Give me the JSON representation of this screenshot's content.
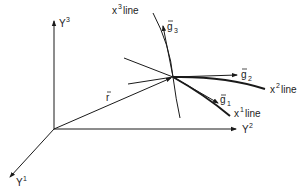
{
  "diagram": {
    "type": "curvilinear-coordinate-system",
    "colors": {
      "ink": "#1a1a1a",
      "background": "#ffffff"
    },
    "axes": [
      {
        "id": "Y1",
        "label": "Y",
        "superscript": "1"
      },
      {
        "id": "Y2",
        "label": "Y",
        "superscript": "2"
      },
      {
        "id": "Y3",
        "label": "Y",
        "superscript": "3"
      }
    ],
    "position_vector": {
      "label": "r",
      "overbar": true
    },
    "coordinate_lines": [
      {
        "id": "x1",
        "label": "x",
        "superscript": "1",
        "suffix": " line"
      },
      {
        "id": "x2",
        "label": "x",
        "superscript": "2",
        "suffix": " line"
      },
      {
        "id": "x3",
        "label": "x",
        "superscript": "3",
        "suffix": " line"
      }
    ],
    "base_vectors": [
      {
        "id": "g1",
        "label": "g",
        "subscript": "1",
        "overbar": true
      },
      {
        "id": "g2",
        "label": "g",
        "subscript": "2",
        "overbar": true
      },
      {
        "id": "g3",
        "label": "g",
        "subscript": "3",
        "overbar": true
      }
    ]
  }
}
